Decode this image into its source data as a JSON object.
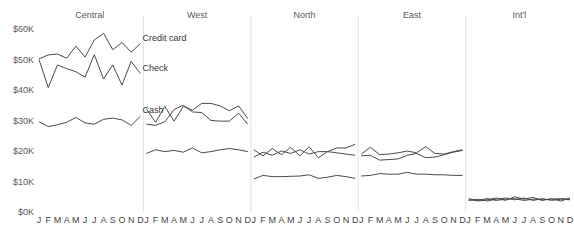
{
  "chart_data": {
    "type": "line",
    "title": "",
    "subtitle": "",
    "xlabel": "",
    "ylabel": "",
    "ylim": [
      0,
      60000
    ],
    "grid": false,
    "legend_position": "inline-annotations",
    "categories": [
      "J",
      "F",
      "M",
      "A",
      "M",
      "J",
      "J",
      "A",
      "S",
      "O",
      "N",
      "D"
    ],
    "ytick_labels": [
      "$0K",
      "$10K",
      "$20K",
      "$30K",
      "$40K",
      "$50K",
      "$60K"
    ],
    "ytick_values": [
      0,
      10000,
      20000,
      30000,
      40000,
      50000,
      60000
    ],
    "panel_variable": "Region",
    "series_variable": "Payment method",
    "panels": [
      {
        "name": "Central",
        "series": [
          {
            "name": "Credit card",
            "values": [
              50200,
              51500,
              51800,
              50400,
              54400,
              50800,
              56400,
              58600,
              53200,
              55600,
              52400,
              55200
            ]
          },
          {
            "name": "Check",
            "values": [
              50000,
              40800,
              48200,
              47000,
              46000,
              44200,
              51600,
              43600,
              48200,
              41600,
              49400,
              45400
            ]
          },
          {
            "name": "Cash",
            "values": [
              29600,
              28000,
              28600,
              29400,
              31000,
              29200,
              28800,
              30400,
              30800,
              30200,
              28400,
              31400
            ]
          }
        ]
      },
      {
        "name": "West",
        "series": [
          {
            "name": "Credit card",
            "values": [
              33800,
              29400,
              34600,
              29800,
              34600,
              33400,
              35600,
              35600,
              34800,
              33200,
              34800,
              30600
            ]
          },
          {
            "name": "Check",
            "values": [
              28800,
              28400,
              29600,
              33600,
              35000,
              32800,
              32600,
              30000,
              29800,
              29800,
              32400,
              28800
            ]
          },
          {
            "name": "Cash",
            "values": [
              19200,
              20400,
              19800,
              20200,
              19600,
              21000,
              19400,
              19800,
              20400,
              20800,
              20400,
              19800
            ]
          }
        ]
      },
      {
        "name": "North",
        "series": [
          {
            "name": "Credit card",
            "values": [
              20400,
              18400,
              20800,
              18800,
              21200,
              18400,
              21400,
              17800,
              19800,
              21000,
              21000,
              22200
            ]
          },
          {
            "name": "Check",
            "values": [
              18000,
              19600,
              18600,
              20000,
              19200,
              20400,
              19000,
              19800,
              19800,
              19400,
              19000,
              18600
            ]
          },
          {
            "name": "Cash",
            "values": [
              10800,
              12000,
              11600,
              11600,
              11700,
              11800,
              12200,
              11000,
              11400,
              12000,
              11600,
              11000
            ]
          }
        ]
      },
      {
        "name": "East",
        "series": [
          {
            "name": "Credit card",
            "values": [
              19000,
              21200,
              18800,
              19000,
              19400,
              20000,
              19400,
              21400,
              19200,
              19000,
              19800,
              20400
            ]
          },
          {
            "name": "Check",
            "values": [
              18400,
              18600,
              17000,
              17200,
              17400,
              18600,
              19200,
              17800,
              18000,
              18800,
              19600,
              20200
            ]
          },
          {
            "name": "Cash",
            "values": [
              11800,
              12000,
              12600,
              12400,
              12400,
              13000,
              12400,
              12400,
              12200,
              12200,
              12000,
              12000
            ]
          }
        ]
      },
      {
        "name": "Int'l",
        "series": [
          {
            "name": "Credit card",
            "values": [
              4400,
              3600,
              4000,
              4600,
              3800,
              5000,
              4200,
              4800,
              3800,
              4400,
              3600,
              4600
            ]
          },
          {
            "name": "Check",
            "values": [
              3800,
              4200,
              3600,
              4200,
              4600,
              4000,
              4600,
              3800,
              4400,
              3800,
              4200,
              4000
            ]
          },
          {
            "name": "Cash",
            "values": [
              4000,
              3800,
              4400,
              3800,
              4200,
              4400,
              3800,
              4200,
              4000,
              4200,
              4400,
              4200
            ]
          }
        ]
      }
    ],
    "annotations": [
      {
        "text": "Credit card",
        "panel": "Central",
        "series": "Credit card"
      },
      {
        "text": "Check",
        "panel": "Central",
        "series": "Check"
      },
      {
        "text": "Cash",
        "panel": "Central",
        "series": "Cash"
      }
    ],
    "colors": {
      "line": "#4a4a4a",
      "axis_text": "#5a5a5a",
      "separator": "#e3e3e3",
      "background": "#ffffff"
    }
  }
}
